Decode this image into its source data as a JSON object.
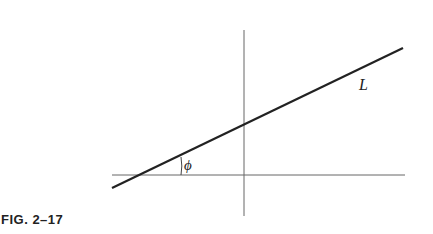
{
  "figure": {
    "caption": "FIG. 2–17",
    "line_label": "L",
    "angle_label": "ϕ"
  },
  "colors": {
    "ink": "#222222",
    "axis": "#555555",
    "background": "#ffffff"
  }
}
